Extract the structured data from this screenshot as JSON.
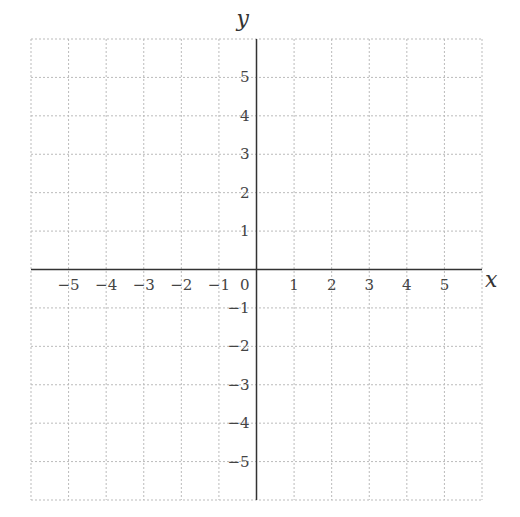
{
  "chart_data": {
    "type": "scatter",
    "title": "",
    "xlabel": "x",
    "ylabel": "y",
    "xlim": [
      -6,
      6
    ],
    "ylim": [
      -6,
      6
    ],
    "grid": true,
    "grid_style": "dotted",
    "x_ticks": [
      -5,
      -4,
      -3,
      -2,
      -1,
      0,
      1,
      2,
      3,
      4,
      5
    ],
    "y_ticks": [
      -5,
      -4,
      -3,
      -2,
      -1,
      1,
      2,
      3,
      4,
      5
    ],
    "origin_label": "0",
    "series": [],
    "legend": null
  },
  "colors": {
    "axis": "#333333",
    "grid": "#bbbbbb",
    "tick_label": "#444444"
  }
}
